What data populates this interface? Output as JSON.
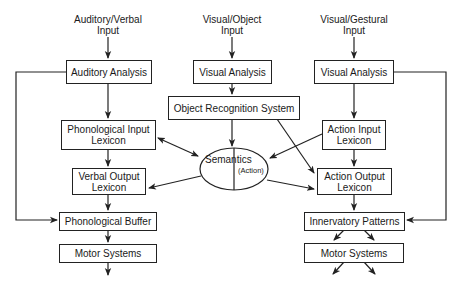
{
  "inputs": {
    "auditory": {
      "line1": "Auditory/Verbal",
      "line2": "Input"
    },
    "visual_object": {
      "line1": "Visual/Object",
      "line2": "Input"
    },
    "visual_gestural": {
      "line1": "Visual/Gestural",
      "line2": "Input"
    }
  },
  "left_column": {
    "auditory_analysis": "Auditory Analysis",
    "phonological_input_lexicon": {
      "line1": "Phonological Input",
      "line2": "Lexicon"
    },
    "verbal_output_lexicon": {
      "line1": "Verbal Output",
      "line2": "Lexicon"
    },
    "phonological_buffer": "Phonological Buffer",
    "motor_systems": "Motor Systems"
  },
  "center_column": {
    "visual_analysis": "Visual Analysis",
    "object_recognition_system": "Object Recognition System",
    "semantics": {
      "label": "Semantics",
      "sublabel": "(Action)"
    }
  },
  "right_column": {
    "visual_analysis": "Visual Analysis",
    "action_input_lexicon": {
      "line1": "Action Input",
      "line2": "Lexicon"
    },
    "action_output_lexicon": {
      "line1": "Action Output",
      "line2": "Lexicon"
    },
    "innervatory_patterns": "Innervatory Patterns",
    "motor_systems": "Motor Systems"
  },
  "colors": {
    "stroke": "#222222",
    "background": "#ffffff",
    "text": "#1a1a1a"
  }
}
